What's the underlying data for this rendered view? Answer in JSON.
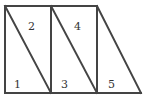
{
  "diagram": {
    "stroke_color": "#444444",
    "text_color": "#333333",
    "labels": [
      {
        "text": "1",
        "x": 14,
        "y": 88
      },
      {
        "text": "2",
        "x": 28,
        "y": 30
      },
      {
        "text": "3",
        "x": 61,
        "y": 88
      },
      {
        "text": "4",
        "x": 74,
        "y": 30
      },
      {
        "text": "5",
        "x": 108,
        "y": 88
      }
    ],
    "segments": [
      {
        "name": "top-edge",
        "x1": 5,
        "y1": 6,
        "x2": 97,
        "y2": 6
      },
      {
        "name": "bottom-edge",
        "x1": 5,
        "y1": 93,
        "x2": 141,
        "y2": 93
      },
      {
        "name": "left-edge",
        "x1": 5,
        "y1": 6,
        "x2": 5,
        "y2": 93
      },
      {
        "name": "vertical-1",
        "x1": 51,
        "y1": 6,
        "x2": 51,
        "y2": 93
      },
      {
        "name": "vertical-2",
        "x1": 97,
        "y1": 6,
        "x2": 97,
        "y2": 93
      },
      {
        "name": "diagonal-1",
        "x1": 5,
        "y1": 6,
        "x2": 51,
        "y2": 93
      },
      {
        "name": "diagonal-2",
        "x1": 51,
        "y1": 6,
        "x2": 97,
        "y2": 93
      },
      {
        "name": "diagonal-3",
        "x1": 97,
        "y1": 6,
        "x2": 141,
        "y2": 93
      }
    ]
  }
}
